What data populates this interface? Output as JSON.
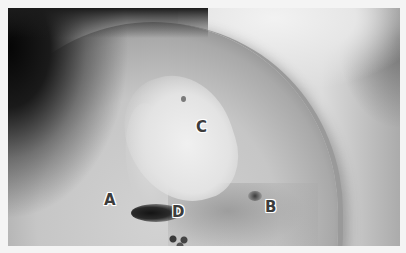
{
  "image": {
    "description": "Grayscale clinical photograph of a shoulder region with lesions marked by letter labels",
    "labels": [
      {
        "id": "A",
        "text": "A"
      },
      {
        "id": "B",
        "text": "B"
      },
      {
        "id": "C",
        "text": "C"
      },
      {
        "id": "D",
        "text": "D"
      }
    ]
  }
}
